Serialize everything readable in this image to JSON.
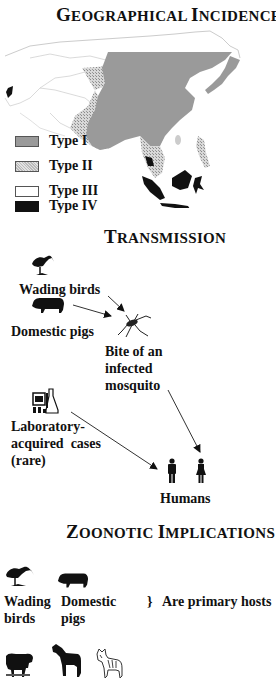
{
  "sections": {
    "geographical": {
      "title_first": "G",
      "title_rest": "EOGRAPHICAL ",
      "title_second_first": "I",
      "title_second_rest": "NCIDENCE"
    },
    "transmission": {
      "title_first": "T",
      "title_rest": "RANSMISSION"
    },
    "zoonotic": {
      "title_first": "Z",
      "title_rest": "OONOTIC ",
      "title_second_first": "I",
      "title_second_rest": "MPLICATIONS"
    }
  },
  "legend": [
    {
      "label": "Type I",
      "color": "#9a9a9a",
      "pattern": "solid-gray"
    },
    {
      "label": "Type II",
      "color": "#c8c8c8",
      "pattern": "stipple"
    },
    {
      "label": "Type III",
      "color": "#ffffff",
      "pattern": "blank"
    },
    {
      "label": "Type IV",
      "color": "#111111",
      "pattern": "solid-black"
    }
  ],
  "transmission": {
    "wading_birds": "Wading birds",
    "domestic_pigs": "Domestic pigs",
    "mosquito_line1": "Bite of an",
    "mosquito_line2": "infected",
    "mosquito_line3": "mosquito",
    "lab_line1": "Laboratory-",
    "lab_line2": "acquired  cases",
    "lab_line3": "(rare)",
    "humans": "Humans"
  },
  "zoonotic": {
    "bird_line1": "Wading",
    "bird_line2": "birds",
    "pig_line1": "Domestic",
    "pig_line2": "pigs",
    "brace": "}",
    "primary_hosts": "Are primary hosts"
  },
  "icons": [
    "wading-bird-icon",
    "pig-icon",
    "mosquito-icon",
    "laboratory-icon",
    "man-icon",
    "woman-icon",
    "sheep-icon",
    "horse-icon",
    "dog-icon"
  ],
  "colors": {
    "type1": "#9a9a9a",
    "type2": "#c8c8c8",
    "type4": "#111111",
    "text": "#111111"
  }
}
